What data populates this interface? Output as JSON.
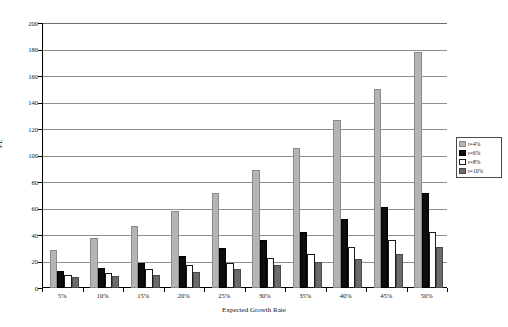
{
  "chart_data": {
    "type": "bar",
    "title": "",
    "xlabel": "Expected Growth Rate",
    "ylabel": "PE",
    "categories": [
      "5%",
      "10%",
      "15%",
      "20%",
      "25%",
      "30%",
      "35%",
      "40%",
      "45%",
      "50%"
    ],
    "ylim": [
      0,
      200
    ],
    "ytick_step": 20,
    "yticks": [
      "0",
      "20",
      "40",
      "60",
      "80",
      "100",
      "120",
      "140",
      "160",
      "180",
      "200"
    ],
    "grid": "horizontal",
    "legend_position": "right",
    "series": [
      {
        "name": "r=4%",
        "color": "#b4b4b4",
        "values": [
          29,
          38,
          47,
          58,
          72,
          89,
          106,
          127,
          150,
          178
        ]
      },
      {
        "name": "r=6%",
        "color": "#0d0d0d",
        "values": [
          13,
          15,
          19,
          24,
          30,
          36,
          42,
          52,
          61,
          72
        ]
      },
      {
        "name": "r=8%",
        "color": "#ffffff",
        "values": [
          10,
          11,
          14,
          17,
          19,
          23,
          26,
          31,
          36,
          42
        ]
      },
      {
        "name": "r=10%",
        "color": "#6b6b6b",
        "values": [
          8,
          9,
          10,
          12,
          14,
          17,
          20,
          22,
          26,
          31
        ]
      }
    ]
  }
}
